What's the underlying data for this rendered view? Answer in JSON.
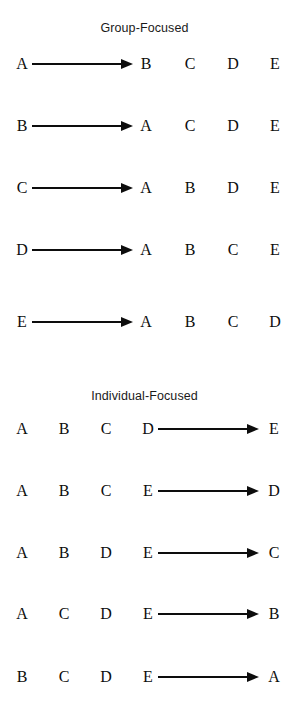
{
  "figure": {
    "background_color": "#ffffff",
    "ink_color": "#0d0d0d",
    "sections": [
      {
        "id": "group-focused",
        "title": "Group-Focused",
        "title_top": 21,
        "arrow_side": "right",
        "rows": [
          {
            "source": "A",
            "targets": [
              "B",
              "C",
              "D",
              "E"
            ],
            "top": 54
          },
          {
            "source": "B",
            "targets": [
              "A",
              "C",
              "D",
              "E"
            ],
            "top": 116
          },
          {
            "source": "C",
            "targets": [
              "A",
              "B",
              "D",
              "E"
            ],
            "top": 178
          },
          {
            "source": "D",
            "targets": [
              "A",
              "B",
              "C",
              "E"
            ],
            "top": 240
          },
          {
            "source": "E",
            "targets": [
              "A",
              "B",
              "C",
              "D"
            ],
            "top": 312
          }
        ]
      },
      {
        "id": "individual-focused",
        "title": "Individual-Focused",
        "title_top": 389,
        "arrow_side": "left",
        "rows": [
          {
            "source": "E",
            "others": [
              "A",
              "B",
              "C",
              "D"
            ],
            "top": 419
          },
          {
            "source": "D",
            "others": [
              "A",
              "B",
              "C",
              "E"
            ],
            "top": 481
          },
          {
            "source": "C",
            "others": [
              "A",
              "B",
              "D",
              "E"
            ],
            "top": 543
          },
          {
            "source": "B",
            "others": [
              "A",
              "C",
              "D",
              "E"
            ],
            "top": 604
          },
          {
            "source": "A",
            "others": [
              "B",
              "C",
              "D",
              "E"
            ],
            "top": 667
          }
        ]
      }
    ]
  },
  "geometry": {
    "group": {
      "source_x": 15,
      "arrow_x": 32,
      "arrow_width": 101,
      "target_xs": [
        139,
        183,
        226,
        268
      ]
    },
    "individual": {
      "other_xs": [
        15,
        57,
        99,
        141
      ],
      "arrow_x": 158,
      "arrow_width": 101,
      "target_x": 267
    }
  }
}
